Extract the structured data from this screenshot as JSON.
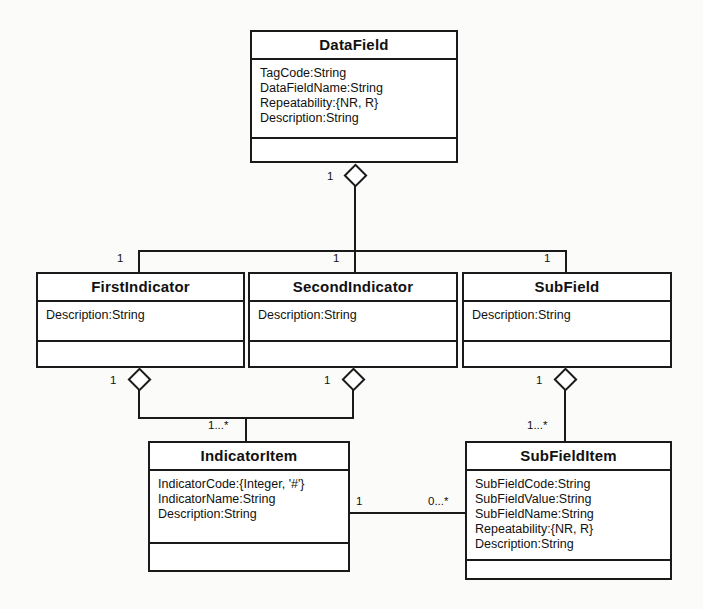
{
  "diagram": {
    "type": "uml-class-diagram",
    "background_color": "#fbfbfa",
    "line_color": "#1a1a1a"
  },
  "classes": {
    "datafield": {
      "name": "DataField",
      "attributes": [
        "TagCode:String",
        "DataFieldName:String",
        "Repeatability:{NR, R}",
        "Description:String"
      ],
      "operations": []
    },
    "firstindicator": {
      "name": "FirstIndicator",
      "attributes": [
        "Description:String"
      ],
      "operations": []
    },
    "secondindicator": {
      "name": "SecondIndicator",
      "attributes": [
        "Description:String"
      ],
      "operations": []
    },
    "subfield": {
      "name": "SubField",
      "attributes": [
        "Description:String"
      ],
      "operations": []
    },
    "indicatoritem": {
      "name": "IndicatorItem",
      "attributes": [
        "IndicatorCode:{Integer, '#'}",
        "IndicatorName:String",
        "Description:String"
      ],
      "operations": []
    },
    "subfielditem": {
      "name": "SubFieldItem",
      "attributes": [
        "SubFieldCode:String",
        "SubFieldValue:String",
        "SubFieldName:String",
        "Repeatability:{NR, R}",
        "Description:String"
      ],
      "operations": []
    }
  },
  "multiplicities": {
    "datafield_agg": "1",
    "firstindicator_end": "1",
    "secondindicator_end": "1",
    "subfield_end": "1",
    "firstindicator_agg": "1",
    "secondindicator_agg": "1",
    "subfield_agg": "1",
    "indicatoritem_end": "1...*",
    "subfielditem_end": "1...*",
    "indicatoritem_assoc": "1",
    "subfielditem_assoc": "0...*"
  }
}
